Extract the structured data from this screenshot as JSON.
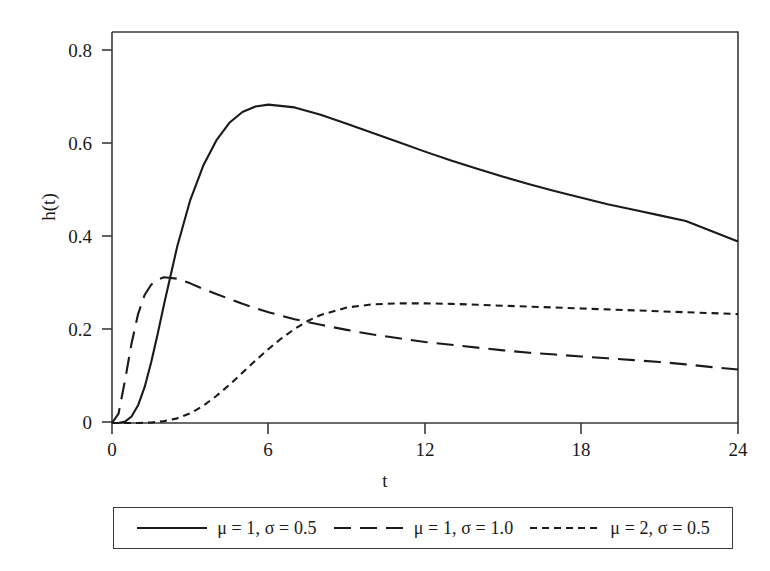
{
  "chart_data": {
    "type": "line",
    "title": "",
    "xlabel": "t",
    "ylabel": "h(t)",
    "xlim": [
      0,
      24
    ],
    "ylim": [
      0,
      0.84
    ],
    "xticks": [
      "0",
      "6",
      "12",
      "18",
      "24"
    ],
    "xtick_values": [
      0,
      6,
      12,
      18,
      24
    ],
    "yticks": [
      "0",
      "0.2",
      "0.4",
      "0.6",
      "0.8"
    ],
    "ytick_values": [
      0,
      0.2,
      0.4,
      0.6,
      0.8
    ],
    "grid": false,
    "legend_position": "below-center",
    "series": [
      {
        "name": "μ = 1, σ = 0.5",
        "style": "solid",
        "color": "#1a1a1a",
        "x": [
          0,
          0.25,
          0.5,
          0.75,
          1.0,
          1.25,
          1.5,
          1.75,
          2.0,
          2.5,
          3.0,
          3.5,
          4.0,
          4.5,
          5.0,
          5.5,
          6.0,
          7.0,
          8.0,
          9.0,
          10.0,
          11.0,
          12.0,
          13.0,
          14.0,
          15.0,
          16.0,
          17.0,
          18.0,
          19.0,
          20.0,
          21.0,
          22.0,
          23.0,
          24.0
        ],
        "y": [
          0.0,
          0.0,
          0.003,
          0.014,
          0.038,
          0.077,
          0.13,
          0.191,
          0.256,
          0.379,
          0.479,
          0.553,
          0.607,
          0.645,
          0.668,
          0.68,
          0.684,
          0.678,
          0.662,
          0.643,
          0.623,
          0.603,
          0.583,
          0.564,
          0.546,
          0.529,
          0.513,
          0.498,
          0.484,
          0.47,
          0.458,
          0.446,
          0.434,
          0.412,
          0.39
        ]
      },
      {
        "name": "μ = 1, σ = 1.0",
        "style": "long-dash",
        "color": "#1a1a1a",
        "x": [
          0,
          0.25,
          0.5,
          0.75,
          1.0,
          1.25,
          1.5,
          1.75,
          2.0,
          2.5,
          3.0,
          3.5,
          4.0,
          5.0,
          6.0,
          7.0,
          8.0,
          9.0,
          10.0,
          11.0,
          12.0,
          13.0,
          14.0,
          15.0,
          16.0,
          17.0,
          18.0,
          19.0,
          20.0,
          21.0,
          22.0,
          23.0,
          24.0
        ],
        "y": [
          0.0,
          0.02,
          0.092,
          0.171,
          0.234,
          0.275,
          0.297,
          0.308,
          0.313,
          0.31,
          0.3,
          0.288,
          0.277,
          0.256,
          0.238,
          0.223,
          0.211,
          0.2,
          0.19,
          0.182,
          0.174,
          0.168,
          0.162,
          0.156,
          0.151,
          0.147,
          0.143,
          0.139,
          0.135,
          0.131,
          0.126,
          0.12,
          0.115
        ]
      },
      {
        "name": "μ = 2, σ = 0.5",
        "style": "short-dash",
        "color": "#1a1a1a",
        "x": [
          0,
          0.5,
          1.0,
          1.5,
          2.0,
          2.5,
          3.0,
          3.5,
          4.0,
          4.5,
          5.0,
          5.5,
          6.0,
          6.5,
          7.0,
          7.5,
          8.0,
          9.0,
          10.0,
          11.0,
          12.0,
          13.0,
          14.0,
          15.0,
          16.0,
          17.0,
          18.0,
          19.0,
          20.0,
          21.0,
          22.0,
          23.0,
          24.0
        ],
        "y": [
          0.0,
          0.0,
          0.0,
          0.001,
          0.004,
          0.01,
          0.021,
          0.037,
          0.058,
          0.082,
          0.108,
          0.134,
          0.159,
          0.182,
          0.202,
          0.219,
          0.232,
          0.248,
          0.255,
          0.257,
          0.257,
          0.256,
          0.254,
          0.252,
          0.25,
          0.248,
          0.246,
          0.244,
          0.242,
          0.24,
          0.238,
          0.236,
          0.234
        ]
      }
    ]
  },
  "legend": {
    "entries": [
      {
        "label": "μ = 1, σ = 0.5",
        "style": "solid"
      },
      {
        "label": "μ = 1, σ = 1.0",
        "style": "long-dash"
      },
      {
        "label": "μ = 2, σ = 0.5",
        "style": "short-dash"
      }
    ]
  },
  "axes": {
    "x_label": "t",
    "y_label": "h(t)",
    "x_ticks": [
      "0",
      "6",
      "12",
      "18",
      "24"
    ],
    "y_ticks": [
      "0.8",
      "0.6",
      "0.4",
      "0.2",
      "0"
    ]
  },
  "colors": {
    "line": "#1a1a1a",
    "axis": "#3a3a3a",
    "background": "#ffffff"
  }
}
